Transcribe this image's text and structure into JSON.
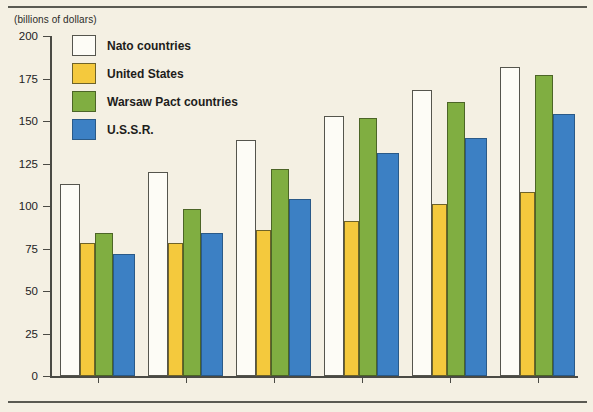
{
  "chart_data": {
    "type": "bar",
    "title": "",
    "subtitle": "",
    "unit_label": "(billions of dollars)",
    "xlabel": "",
    "ylabel": "",
    "ylim": [
      0,
      200
    ],
    "ytick_values": [
      200,
      175,
      150,
      125,
      100,
      75,
      50,
      25,
      0
    ],
    "ytick_labels": [
      "200",
      "175",
      "150",
      "125",
      "100",
      "75",
      "50",
      "25",
      "0"
    ],
    "grid": false,
    "legend_position": "upper-left-inside",
    "categories": [
      "1970",
      "1972",
      "1974",
      "1976",
      "1977",
      "1978"
    ],
    "series": [
      {
        "name": "Nato countries",
        "key": "nato",
        "color": "#fdfcf6",
        "edge_color": "#55554d",
        "values": [
          113,
          120,
          139,
          153,
          168,
          182
        ]
      },
      {
        "name": "United States",
        "key": "us",
        "color": "#f4c93d",
        "edge_color": "#6e6329",
        "values": [
          78,
          78,
          86,
          91,
          101,
          108
        ]
      },
      {
        "name": "Warsaw Pact countries",
        "key": "wp",
        "color": "#80ae41",
        "edge_color": "#4c6527",
        "values": [
          84,
          98,
          122,
          152,
          161,
          177
        ]
      },
      {
        "name": "U.S.S.R.",
        "key": "su",
        "color": "#3c80c4",
        "edge_color": "#2a5a88",
        "values": [
          72,
          84,
          104,
          131,
          140,
          154
        ]
      }
    ]
  },
  "figure": {
    "background_color": "#f4f0e3",
    "rule_color": "#5a5a52",
    "axis_color": "#4a4a44"
  }
}
